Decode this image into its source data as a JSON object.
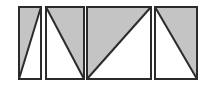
{
  "diagram": {
    "title": "",
    "colors": {
      "background": "#ffffff",
      "stroke": "#2b2b2b",
      "shade": "#c4c4c4"
    },
    "panels": [
      {
        "id": "panel-1",
        "x": 19,
        "y": 7,
        "w": 22,
        "h": 72,
        "shaded": [
          [
            19,
            7
          ],
          [
            41,
            7
          ],
          [
            19,
            79
          ]
        ],
        "diagonal": [
          [
            41,
            7
          ],
          [
            19,
            79
          ]
        ]
      },
      {
        "id": "panel-2",
        "x": 46,
        "y": 7,
        "w": 38,
        "h": 72,
        "shaded": [
          [
            46,
            7
          ],
          [
            84,
            7
          ],
          [
            84,
            79
          ]
        ],
        "diagonal": [
          [
            46,
            7
          ],
          [
            84,
            79
          ]
        ]
      },
      {
        "id": "panel-3",
        "x": 87,
        "y": 7,
        "w": 64,
        "h": 72,
        "shaded": [
          [
            87,
            7
          ],
          [
            151,
            7
          ],
          [
            87,
            79
          ]
        ],
        "diagonal": [
          [
            151,
            7
          ],
          [
            87,
            79
          ]
        ]
      },
      {
        "id": "panel-4",
        "x": 155,
        "y": 7,
        "w": 42,
        "h": 72,
        "shaded": [
          [
            155,
            7
          ],
          [
            197,
            7
          ],
          [
            197,
            79
          ]
        ],
        "diagonal": [
          [
            155,
            7
          ],
          [
            197,
            79
          ]
        ]
      }
    ]
  }
}
